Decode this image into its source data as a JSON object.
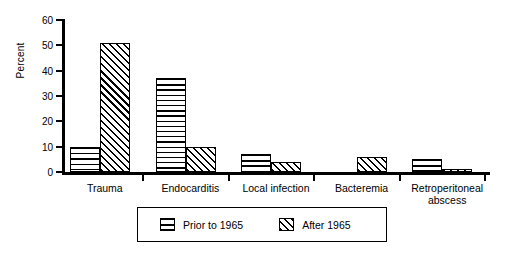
{
  "chart_data": {
    "type": "bar",
    "title": "",
    "xlabel": "",
    "ylabel": "Percent",
    "ylim": [
      0,
      60
    ],
    "yticks": [
      0,
      10,
      20,
      30,
      40,
      50,
      60
    ],
    "grid": false,
    "legend_position": "bottom-center",
    "categories": [
      "Trauma",
      "Endocarditis",
      "Local infection",
      "Bacteremia",
      "Retroperitoneal\nabscess"
    ],
    "series": [
      {
        "name": "Prior to 1965",
        "pattern": "horizontal-lines",
        "values": [
          10,
          37,
          7,
          0,
          5
        ]
      },
      {
        "name": "After 1965",
        "pattern": "diagonal-hatch",
        "values": [
          51,
          10,
          4,
          6,
          1
        ]
      }
    ]
  },
  "legend": {
    "items": [
      {
        "label": "Prior to 1965",
        "swatch": "horizontal-lines-swatch"
      },
      {
        "label": "After 1965",
        "swatch": "diagonal-hatch-swatch"
      }
    ]
  },
  "colors": {
    "ink": "#000000",
    "background": "#ffffff"
  }
}
